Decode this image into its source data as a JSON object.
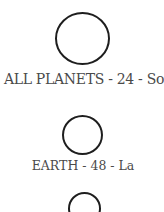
{
  "items": [
    {
      "label": "ALL PLANETS - 24 - So",
      "icon": "circle-planet-icon"
    },
    {
      "label": "EARTH - 48 - La",
      "icon": "circle-planet-icon"
    },
    {
      "label": "",
      "icon": "circle-planet-icon"
    }
  ],
  "colors": {
    "stroke": "#1e1e1e",
    "text": "#4a4a4a",
    "background": "#ffffff"
  }
}
